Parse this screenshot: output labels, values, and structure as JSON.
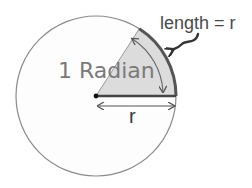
{
  "diagram": {
    "title": "1 Radian",
    "labels": {
      "angle": "1 Radian",
      "arc_length": "length = r",
      "radius": "r"
    },
    "geometry": {
      "center": [
        96,
        96
      ],
      "radius": 80,
      "angle_degrees": 57.3
    },
    "colors": {
      "circle_stroke": "#888888",
      "sector_fill": "#dcdcdc",
      "arc_stroke": "#555555",
      "radius_stroke": "#444444",
      "text_gray": "#7a7a7a",
      "text_dark": "#444444"
    }
  }
}
